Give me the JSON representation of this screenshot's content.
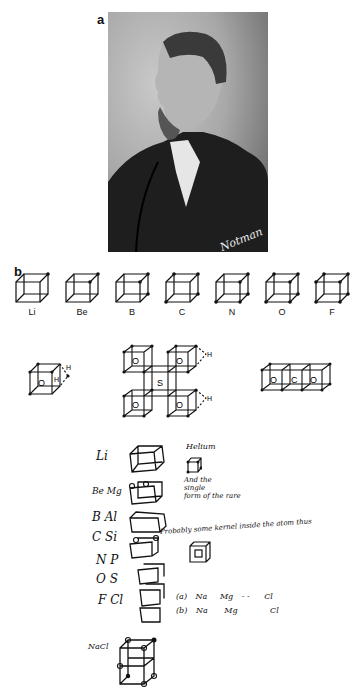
{
  "panels": {
    "a": {
      "label": "a",
      "photo": {
        "description": "portrait-photograph",
        "signature": "Notman"
      }
    },
    "b": {
      "label": "b",
      "cube_series": [
        {
          "symbol": "Li",
          "electrons": 1
        },
        {
          "symbol": "Be",
          "electrons": 2
        },
        {
          "symbol": "B",
          "electrons": 3
        },
        {
          "symbol": "C",
          "electrons": 4
        },
        {
          "symbol": "N",
          "electrons": 5
        },
        {
          "symbol": "O",
          "electrons": 6
        },
        {
          "symbol": "F",
          "electrons": 7
        }
      ],
      "structures": {
        "water": {
          "atoms": [
            "O",
            "H",
            "H"
          ]
        },
        "sulfate": {
          "center": "S",
          "corners": [
            "O",
            "O",
            "O",
            "O"
          ],
          "hydrogens": [
            "H",
            "H"
          ]
        },
        "co2": {
          "atoms": [
            "O",
            "C",
            "O"
          ]
        }
      }
    }
  },
  "handwritten": {
    "rows": [
      {
        "elements": "Li"
      },
      {
        "elements": "Be Mg"
      },
      {
        "elements": "B Al"
      },
      {
        "elements": "C Si"
      },
      {
        "elements": "N P"
      },
      {
        "elements": "O S"
      },
      {
        "elements": "F Cl"
      }
    ],
    "helium_note": "Helium",
    "atom_note_lines": [
      "And the",
      "single",
      "form of the rare"
    ],
    "probably_note": "Probably some kernel inside the atom thus",
    "equation_a": {
      "prefix": "(a)",
      "terms": [
        "Na",
        "Mg",
        "- -",
        "Cl"
      ]
    },
    "equation_b": {
      "prefix": "(b)",
      "terms": [
        "Na",
        "Mg",
        "Cl"
      ]
    },
    "nacl_label": "NaCl"
  }
}
